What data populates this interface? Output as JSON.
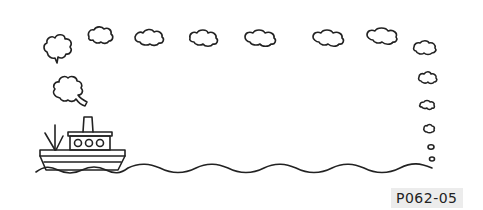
{
  "image": {
    "description": "Line-art clip-art frame: a steamship on wavy water with a border of puffy clouds across the top and down the right side",
    "label": "P062-05",
    "stroke_color": "#222222",
    "background_color": "#ffffff",
    "label_background": "#ececec"
  },
  "elements": {
    "ship": {
      "name": "steamship",
      "portholes": 3
    },
    "clouds_top_count": 8,
    "clouds_right_count": 6,
    "waterline": "wavy line"
  }
}
